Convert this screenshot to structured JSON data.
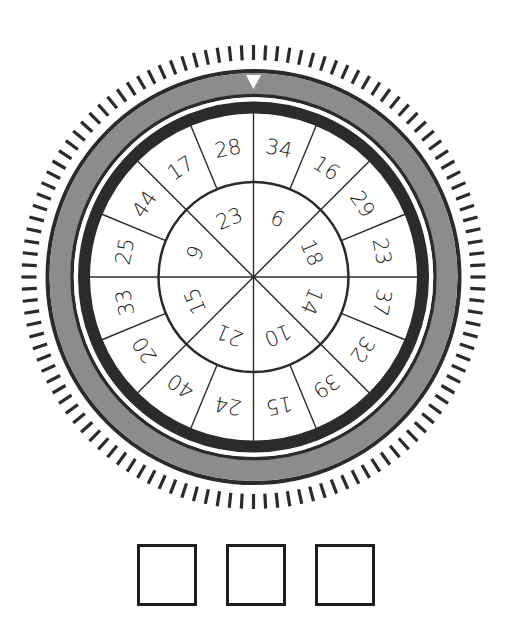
{
  "puzzle": {
    "type": "rotating-number-wheel",
    "pointer": "top",
    "tick_count": 120,
    "outer_ring_sectors_clockwise_from_top": [
      34,
      16,
      29,
      23,
      37,
      32,
      39,
      15,
      24,
      40,
      20,
      33,
      25,
      44,
      17,
      28
    ],
    "inner_ring_sectors_clockwise_from_top": [
      6,
      18,
      14,
      10,
      21,
      15,
      9,
      23
    ],
    "answer_boxes": [
      "",
      "",
      ""
    ]
  },
  "colors": {
    "dark": "#2b2b2b",
    "band": "#8c8c8c",
    "text": "#222222",
    "background": "#ffffff"
  }
}
